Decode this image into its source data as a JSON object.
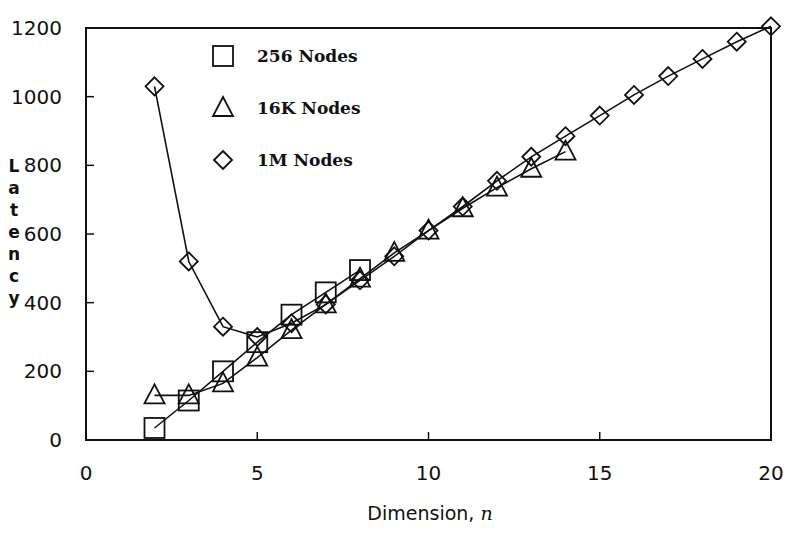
{
  "chart_data": {
    "type": "line",
    "title": "",
    "xlabel": "Dimension, n",
    "ylabel": "Latency",
    "xlim": [
      0,
      20
    ],
    "ylim": [
      0,
      1200
    ],
    "xticks": [
      0,
      5,
      10,
      15,
      20
    ],
    "yticks": [
      0,
      200,
      400,
      600,
      800,
      1000,
      1200
    ],
    "grid": false,
    "legend_position": "upper-left-inside",
    "series": [
      {
        "name": "256 Nodes",
        "marker": "square",
        "x": [
          2,
          3,
          4,
          5,
          6,
          7,
          8
        ],
        "values": [
          35,
          115,
          200,
          285,
          365,
          430,
          495
        ]
      },
      {
        "name": "16K Nodes",
        "marker": "triangle",
        "x": [
          2,
          3,
          4,
          5,
          6,
          7,
          8,
          9,
          10,
          11,
          12,
          13,
          14
        ],
        "values": [
          130,
          130,
          165,
          240,
          320,
          395,
          470,
          545,
          610,
          675,
          735,
          790,
          840
        ]
      },
      {
        "name": "1M Nodes",
        "marker": "diamond",
        "x": [
          2,
          3,
          4,
          5,
          6,
          7,
          8,
          9,
          10,
          11,
          12,
          13,
          14,
          15,
          16,
          17,
          18,
          19,
          20
        ],
        "values": [
          1030,
          520,
          330,
          300,
          340,
          395,
          465,
          535,
          610,
          680,
          755,
          825,
          885,
          945,
          1005,
          1060,
          1110,
          1160,
          1205
        ]
      }
    ]
  },
  "legend": {
    "items": [
      {
        "label": "256 Nodes",
        "icon": "square-marker-icon"
      },
      {
        "label": "16K Nodes",
        "icon": "triangle-marker-icon"
      },
      {
        "label": "1M Nodes",
        "icon": "diamond-marker-icon"
      }
    ]
  },
  "axes": {
    "x_title": "Dimension, ",
    "x_title_var": "n",
    "y_title_letters": [
      "L",
      "a",
      "t",
      "e",
      "n",
      "c",
      "y"
    ],
    "x_tick_labels": [
      "0",
      "5",
      "10",
      "15",
      "20"
    ],
    "y_tick_labels": [
      "0",
      "200",
      "400",
      "600",
      "800",
      "1000",
      "1200"
    ]
  },
  "colors": {
    "ink": "#111111",
    "background": "#ffffff"
  }
}
